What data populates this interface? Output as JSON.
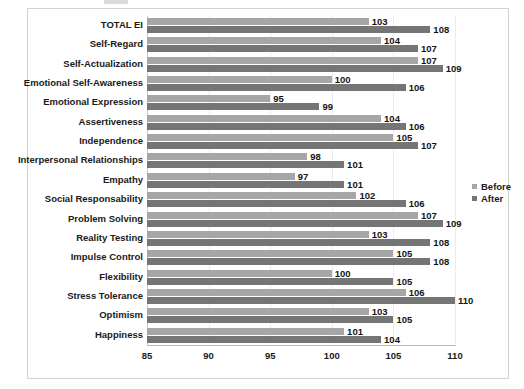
{
  "chart_data": {
    "type": "bar",
    "orientation": "horizontal",
    "title": "",
    "xlabel": "",
    "ylabel": "",
    "xlim": [
      85,
      110
    ],
    "xticks": [
      "85",
      "90",
      "95",
      "100",
      "105",
      "110"
    ],
    "grid": true,
    "grid_axis": "x",
    "legend_position": "right",
    "categories": [
      "TOTAL EI",
      "Self-Regard",
      "Self-Actualization",
      "Emotional Self-Awareness",
      "Emotional Expression",
      "Assertiveness",
      "Independence",
      "Interpersonal Relationships",
      "Empathy",
      "Social Responsability",
      "Problem Solving",
      "Reality Testing",
      "Impulse Control",
      "Flexibility",
      "Stress Tolerance",
      "Optimism",
      "Happiness"
    ],
    "series": [
      {
        "name": "Before",
        "color": "#a6a6a6",
        "values": [
          103,
          104,
          107,
          100,
          95,
          104,
          105,
          98,
          97,
          102,
          107,
          103,
          105,
          100,
          106,
          103,
          101
        ]
      },
      {
        "name": "After",
        "color": "#757575",
        "values": [
          108,
          107,
          109,
          106,
          99,
          106,
          107,
          101,
          101,
          106,
          109,
          108,
          108,
          105,
          110,
          105,
          104
        ]
      }
    ]
  },
  "legend": {
    "items": [
      {
        "label": "Before",
        "color": "#a6a6a6"
      },
      {
        "label": "After",
        "color": "#757575"
      }
    ]
  }
}
